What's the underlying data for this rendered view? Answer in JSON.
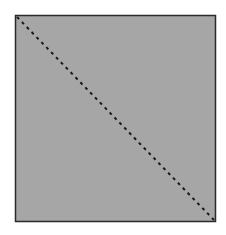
{
  "figure": {
    "shape": "square",
    "fill_color": "#a6a6a6",
    "border_color": "#2a2a2a",
    "diagonal": {
      "from": "top-left",
      "to": "bottom-right",
      "style": "dashed",
      "color": "#1a1a1a"
    }
  }
}
